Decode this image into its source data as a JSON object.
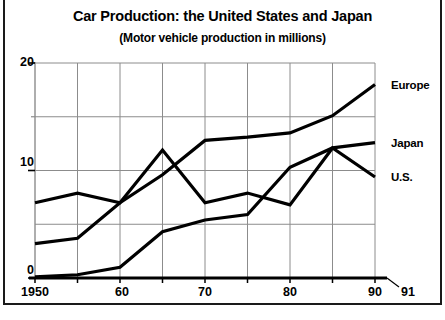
{
  "chart_data": {
    "type": "line",
    "title": "Car Production: the United States and Japan",
    "subtitle": "(Motor vehicle production in millions)",
    "xlabel": "",
    "ylabel": "",
    "xlim": [
      1950,
      1991
    ],
    "ylim": [
      0,
      20
    ],
    "grid": true,
    "legend_position": "right-inline",
    "y_ticks": [
      0,
      10,
      20
    ],
    "y_tick_labels": [
      "0",
      "10",
      "20"
    ],
    "y_gridlines": [
      5,
      10,
      15,
      20
    ],
    "x_ticks": [
      1950,
      1955,
      1960,
      1965,
      1970,
      1975,
      1980,
      1985,
      1990,
      1991
    ],
    "x_tick_labels": [
      "1950",
      "",
      "60",
      "",
      "70",
      "",
      "80",
      "",
      "90",
      "91"
    ],
    "x": [
      1950,
      1955,
      1960,
      1965,
      1970,
      1975,
      1980,
      1985,
      1990
    ],
    "series": [
      {
        "name": "Europe",
        "label": "Europe",
        "values": [
          3.2,
          3.7,
          7.0,
          9.6,
          12.8,
          13.1,
          13.5,
          15.1,
          18.0
        ],
        "color": "#000000"
      },
      {
        "name": "Japan",
        "label": "Japan",
        "values": [
          0.1,
          0.3,
          1.0,
          4.3,
          5.4,
          5.9,
          10.3,
          12.1,
          12.6
        ],
        "color": "#000000"
      },
      {
        "name": "U.S.",
        "label": "U.S.",
        "values": [
          7.0,
          7.9,
          7.0,
          11.9,
          7.0,
          7.9,
          6.8,
          12.1,
          9.4
        ],
        "color": "#000000"
      }
    ]
  },
  "axis": {
    "y_20": "20",
    "y_10": "10",
    "y_0": "0",
    "x_1950": "1950",
    "x_60": "60",
    "x_70": "70",
    "x_80": "80",
    "x_90": "90",
    "x_91": "91"
  },
  "labels": {
    "europe": "Europe",
    "japan": "Japan",
    "us": "U.S."
  },
  "colors": {
    "line": "#000000",
    "grid": "#8c8c8c",
    "axis": "#000000",
    "background": "#ffffff"
  }
}
